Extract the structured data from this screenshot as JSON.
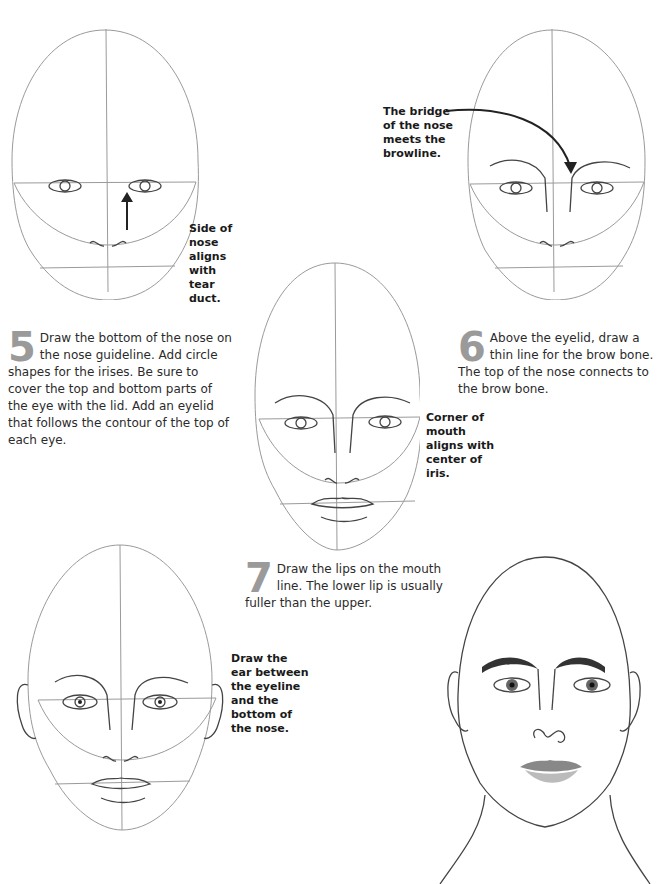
{
  "steps": [
    {
      "number": "5",
      "text": "Draw the bottom of the nose on the nose guideline. Add circle shapes for the irises. Be sure to cover the top and bottom parts of the eye with the lid. Add an eyelid that follows the contour of the top of each eye."
    },
    {
      "number": "6",
      "text": "Above the eyelid, draw a thin line for the brow bone. The top of the nose connects to the brow bone."
    },
    {
      "number": "7",
      "text": "Draw the lips on the mouth line. The lower lip is usually fuller than the upper."
    }
  ],
  "callouts": {
    "tear_duct": "Side of nose aligns with tear duct.",
    "bridge": "The bridge of the nose meets the browline.",
    "mouth_corner": "Corner of mouth aligns with center of iris.",
    "ear": "Draw the ear between the eyeline and the bottom of the nose."
  },
  "figures": [
    {
      "id": "step5-head",
      "description": "Head outline with guidelines, eyes and nose base"
    },
    {
      "id": "step6-head",
      "description": "Head with brow lines and nose bridge"
    },
    {
      "id": "step7-head",
      "description": "Head with lips added"
    },
    {
      "id": "step8-head",
      "description": "Head with ears and irises"
    },
    {
      "id": "final-portrait",
      "description": "Finished shaded portrait with neck"
    }
  ],
  "colors": {
    "step_number": "#9a9a9a",
    "guide_line": "#9a9a9a",
    "text": "#2b2b2b"
  }
}
